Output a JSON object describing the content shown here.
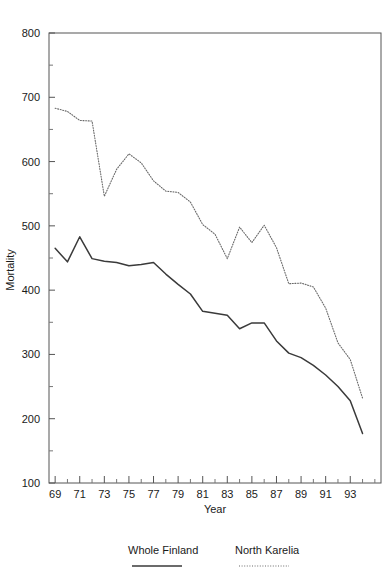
{
  "chart_data": {
    "type": "line",
    "title": "",
    "xlabel": "Year",
    "ylabel": "Mortality",
    "xlim": [
      68.5,
      95.5
    ],
    "ylim": [
      100,
      800
    ],
    "yticks": [
      100,
      200,
      300,
      400,
      500,
      600,
      700,
      800
    ],
    "ytick_labels": [
      "100",
      "200",
      "300",
      "400",
      "500",
      "600",
      "700",
      "800"
    ],
    "xticks": [
      69,
      71,
      73,
      75,
      77,
      79,
      81,
      83,
      85,
      87,
      89,
      91,
      93
    ],
    "xtick_labels": [
      "69",
      "71",
      "73",
      "75",
      "77",
      "79",
      "81",
      "83",
      "85",
      "87",
      "89",
      "91",
      "93"
    ],
    "x_minor_ticks": [
      70,
      72,
      74,
      76,
      78,
      80,
      82,
      84,
      86,
      88,
      90,
      92,
      94,
      95
    ],
    "y_minor_ticks": [
      150,
      250,
      350,
      450,
      550,
      650,
      750
    ],
    "grid": false,
    "legend_position": "below",
    "x": [
      69,
      70,
      71,
      72,
      73,
      74,
      75,
      76,
      77,
      78,
      79,
      80,
      81,
      82,
      83,
      84,
      85,
      86,
      87,
      88,
      89,
      90,
      91,
      92,
      93,
      94
    ],
    "series": [
      {
        "name": "Whole Finland",
        "style": "solid",
        "color": "#3a3a3a",
        "values": [
          465,
          444,
          483,
          449,
          445,
          443,
          438,
          440,
          443,
          425,
          409,
          394,
          367,
          364,
          361,
          340,
          349,
          349,
          321,
          302,
          295,
          283,
          268,
          250,
          228,
          177
        ]
      },
      {
        "name": "North Karelia",
        "style": "dotted",
        "color": "#6b6b6b",
        "values": [
          683,
          678,
          664,
          663,
          546,
          588,
          612,
          598,
          570,
          554,
          552,
          537,
          502,
          487,
          449,
          498,
          474,
          501,
          466,
          410,
          411,
          405,
          372,
          318,
          292,
          232
        ]
      }
    ]
  },
  "legend": {
    "items": [
      {
        "label": "Whole Finland",
        "style": "solid"
      },
      {
        "label": "North Karelia",
        "style": "dotted"
      }
    ]
  }
}
